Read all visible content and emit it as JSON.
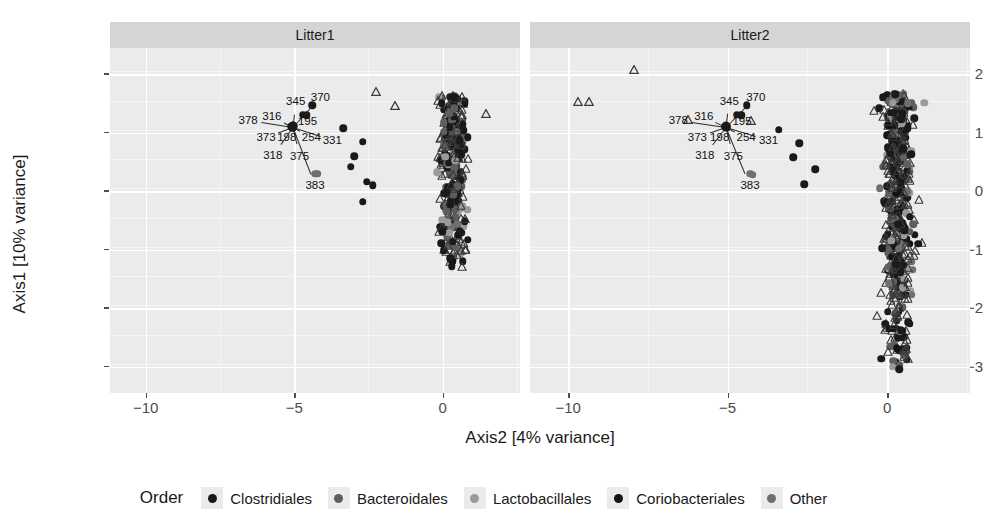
{
  "chart_data": {
    "type": "scatter",
    "title": "",
    "xlabel": "Axis2 [4% variance]",
    "ylabel": "Axis1 [10% variance]",
    "xlim": [
      -11.2,
      2.6
    ],
    "ylim": [
      -3.45,
      2.45
    ],
    "xticks": [
      -10,
      -5,
      0
    ],
    "xtick_labels": [
      "-10",
      "-5",
      "0"
    ],
    "yticks": [
      2,
      1,
      0,
      -1,
      -2,
      -3
    ],
    "ytick_labels": [
      "2",
      "1",
      "0",
      "-1",
      "-2",
      "-3"
    ],
    "grid": true,
    "facets": [
      "Litter1",
      "Litter2"
    ],
    "legend_position": "bottom",
    "legend_title": "Order",
    "series": [
      {
        "name": "Clostridiales",
        "color": "#1a1a1a"
      },
      {
        "name": "Bacteroidales",
        "color": "#5e5e5e"
      },
      {
        "name": "Lactobacillales",
        "color": "#9a9a9a"
      },
      {
        "name": "Coriobacteriales",
        "color": "#141414"
      },
      {
        "name": "Other",
        "color": "#6f6f6f"
      }
    ],
    "marker_shapes": {
      "circle": "filled-circle",
      "triangle": "open-triangle"
    },
    "annotations": [
      {
        "label": "378",
        "x": -6.55,
        "y": 1.22
      },
      {
        "label": "316",
        "x": -5.75,
        "y": 1.28
      },
      {
        "label": "345",
        "x": -4.95,
        "y": 1.55
      },
      {
        "label": "370",
        "x": -4.12,
        "y": 1.62
      },
      {
        "label": "195",
        "x": -4.55,
        "y": 1.21
      },
      {
        "label": "373",
        "x": -5.95,
        "y": 0.93
      },
      {
        "label": "198",
        "x": -5.25,
        "y": 0.92
      },
      {
        "label": "254",
        "x": -4.42,
        "y": 0.92
      },
      {
        "label": "331",
        "x": -3.72,
        "y": 0.88
      },
      {
        "label": "318",
        "x": -5.72,
        "y": 0.62
      },
      {
        "label": "375",
        "x": -4.82,
        "y": 0.6
      },
      {
        "label": "383",
        "x": -4.3,
        "y": 0.1
      }
    ],
    "panels": [
      {
        "name": "Litter1",
        "outlier_points": [
          {
            "x": -2.25,
            "y": 1.7,
            "shape": "triangle",
            "order": "Lactobacillales"
          },
          {
            "x": -1.62,
            "y": 1.45,
            "shape": "triangle",
            "order": "Lactobacillales"
          },
          {
            "x": 1.45,
            "y": 1.32,
            "shape": "triangle",
            "order": "Lactobacillales"
          },
          {
            "x": -4.4,
            "y": 1.47,
            "shape": "circle",
            "order": "Clostridiales"
          },
          {
            "x": -3.35,
            "y": 1.08,
            "shape": "circle",
            "order": "Clostridiales"
          },
          {
            "x": -2.7,
            "y": 0.85,
            "shape": "circle",
            "order": "Clostridiales"
          },
          {
            "x": -2.98,
            "y": 0.6,
            "shape": "circle",
            "order": "Clostridiales"
          },
          {
            "x": -3.1,
            "y": 0.42,
            "shape": "circle",
            "order": "Clostridiales"
          },
          {
            "x": -4.22,
            "y": 0.3,
            "shape": "circle",
            "order": "Other"
          },
          {
            "x": -2.55,
            "y": 0.16,
            "shape": "circle",
            "order": "Clostridiales"
          },
          {
            "x": -2.35,
            "y": 0.1,
            "shape": "circle",
            "order": "Clostridiales"
          },
          {
            "x": -2.7,
            "y": -0.18,
            "shape": "circle",
            "order": "Clostridiales"
          }
        ],
        "cluster": {
          "x_center": 0.35,
          "y_top": 1.65,
          "y_bottom": -1.35,
          "n": 330
        }
      },
      {
        "name": "Litter2",
        "outlier_points": [
          {
            "x": -7.95,
            "y": 2.08,
            "shape": "triangle",
            "order": "Lactobacillales"
          },
          {
            "x": -9.7,
            "y": 1.52,
            "shape": "triangle",
            "order": "Lactobacillales"
          },
          {
            "x": -9.35,
            "y": 1.52,
            "shape": "triangle",
            "order": "Lactobacillales"
          },
          {
            "x": -4.4,
            "y": 1.47,
            "shape": "circle",
            "order": "Clostridiales"
          },
          {
            "x": -3.4,
            "y": 1.05,
            "shape": "circle",
            "order": "Clostridiales"
          },
          {
            "x": -2.75,
            "y": 0.82,
            "shape": "circle",
            "order": "Clostridiales"
          },
          {
            "x": -2.95,
            "y": 0.58,
            "shape": "circle",
            "order": "Clostridiales"
          },
          {
            "x": -2.25,
            "y": 0.38,
            "shape": "circle",
            "order": "Clostridiales"
          },
          {
            "x": -4.22,
            "y": 0.28,
            "shape": "circle",
            "order": "Other"
          },
          {
            "x": -2.6,
            "y": 0.12,
            "shape": "circle",
            "order": "Clostridiales"
          }
        ],
        "cluster": {
          "x_center": 0.35,
          "y_top": 1.7,
          "y_bottom": -3.05,
          "n": 520
        }
      }
    ]
  },
  "axis": {
    "y_title": "Axis1 [10% variance]",
    "x_title": "Axis2 [4% variance]"
  },
  "panels": {
    "left_title": "Litter1",
    "right_title": "Litter2"
  },
  "legend": {
    "title": "Order",
    "items": [
      {
        "label": "Clostridiales",
        "color": "#1a1a1a"
      },
      {
        "label": "Bacteroidales",
        "color": "#5e5e5e"
      },
      {
        "label": "Lactobacillales",
        "color": "#9a9a9a"
      },
      {
        "label": "Coriobacteriales",
        "color": "#141414"
      },
      {
        "label": "Other",
        "color": "#6f6f6f"
      }
    ]
  }
}
